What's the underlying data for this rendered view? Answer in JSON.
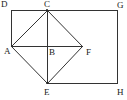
{
  "diagram": {
    "type": "geometry",
    "stroke_color": "#333333",
    "points": {
      "D": {
        "label": "D",
        "x": 11,
        "y": 10,
        "lx": 1,
        "ly": 7
      },
      "C": {
        "label": "C",
        "x": 47,
        "y": 10,
        "lx": 44,
        "ly": 7
      },
      "G": {
        "label": "G",
        "x": 117,
        "y": 10,
        "lx": 117,
        "ly": 8
      },
      "A": {
        "label": "A",
        "x": 11,
        "y": 46,
        "lx": 4,
        "ly": 54
      },
      "B": {
        "label": "B",
        "x": 47,
        "y": 46,
        "lx": 49,
        "ly": 55
      },
      "F": {
        "label": "F",
        "x": 82,
        "y": 46,
        "lx": 86,
        "ly": 55
      },
      "E": {
        "label": "E",
        "x": 47,
        "y": 83,
        "lx": 44,
        "ly": 95
      },
      "H": {
        "label": "H",
        "x": 117,
        "y": 83,
        "lx": 117,
        "ly": 95
      }
    },
    "segments": [
      [
        "D",
        "G"
      ],
      [
        "D",
        "A"
      ],
      [
        "G",
        "H"
      ],
      [
        "E",
        "H"
      ],
      [
        "A",
        "C"
      ],
      [
        "C",
        "F"
      ],
      [
        "F",
        "E"
      ],
      [
        "E",
        "A"
      ],
      [
        "C",
        "E"
      ],
      [
        "A",
        "F"
      ]
    ]
  }
}
